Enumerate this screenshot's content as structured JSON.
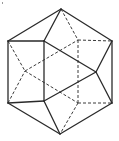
{
  "diagram": {
    "type": "polyhedron-line-drawing",
    "colors": {
      "line": "#2a2a2a",
      "hidden_line": "#3a3a3a",
      "background": "#ffffff"
    },
    "vertices": {
      "T": [
        61,
        9
      ],
      "B": [
        60,
        134
      ],
      "UL": [
        8,
        41
      ],
      "LL": [
        8,
        103
      ],
      "UR": [
        112,
        41
      ],
      "LR": [
        112,
        103
      ],
      "F1": [
        44,
        41
      ],
      "F2": [
        44,
        101
      ],
      "R": [
        96,
        72
      ],
      "H1": [
        25,
        71
      ],
      "H2": [
        78,
        40
      ],
      "H3": [
        78,
        103
      ]
    },
    "solid_edges": [
      [
        "T",
        "UR"
      ],
      [
        "UR",
        "LR"
      ],
      [
        "LR",
        "B"
      ],
      [
        "B",
        "LL"
      ],
      [
        "LL",
        "UL"
      ],
      [
        "UL",
        "T"
      ],
      [
        "UL",
        "F1"
      ],
      [
        "F1",
        "F2"
      ],
      [
        "F2",
        "LL"
      ],
      [
        "T",
        "F1"
      ],
      [
        "F1",
        "R"
      ],
      [
        "F2",
        "R"
      ],
      [
        "R",
        "UR"
      ],
      [
        "R",
        "LR"
      ],
      [
        "F2",
        "B"
      ]
    ],
    "dashed_edges": [
      [
        "T",
        "H2"
      ],
      [
        "H2",
        "UR"
      ],
      [
        "H2",
        "H3"
      ],
      [
        "H3",
        "LR"
      ],
      [
        "H3",
        "B"
      ],
      [
        "UL",
        "H1"
      ],
      [
        "LL",
        "H1"
      ],
      [
        "H1",
        "H2"
      ],
      [
        "H1",
        "H3"
      ]
    ]
  }
}
